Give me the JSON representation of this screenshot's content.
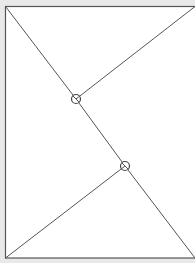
{
  "diagram": {
    "background": "#e9e9e9",
    "panel_fill": "#ffffff",
    "stroke_color": "#555555",
    "frame": {
      "x": 5,
      "y": 6,
      "width": 195,
      "height": 252
    },
    "lines": [
      {
        "id": "diag-top-left",
        "x1": 5,
        "y1": 6,
        "x2": 76,
        "y2": 99
      },
      {
        "id": "mid-segment",
        "x1": 76,
        "y1": 99,
        "x2": 125,
        "y2": 166
      },
      {
        "id": "diag-bottom-right",
        "x1": 125,
        "y1": 166,
        "x2": 195,
        "y2": 258
      },
      {
        "id": "branch-top-right",
        "x1": 76,
        "y1": 99,
        "x2": 195,
        "y2": 6
      },
      {
        "id": "branch-bottom-left",
        "x1": 125,
        "y1": 166,
        "x2": 5,
        "y2": 258
      }
    ],
    "junctions": [
      {
        "id": "junction-upper",
        "cx": 76,
        "cy": 99,
        "r": 4.5
      },
      {
        "id": "junction-lower",
        "cx": 125,
        "cy": 166,
        "r": 4.5
      }
    ]
  }
}
